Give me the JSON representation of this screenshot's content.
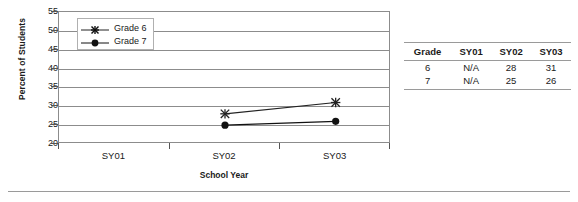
{
  "chart_data": {
    "type": "line",
    "title": "",
    "xlabel": "School Year",
    "ylabel": "Percent of Students",
    "categories": [
      "SY01",
      "SY02",
      "SY03"
    ],
    "ylim": [
      20,
      55
    ],
    "ytick_step": 5,
    "yticks": [
      55,
      50,
      45,
      40,
      35,
      30,
      25,
      20
    ],
    "grid": true,
    "legend_position": "top-left-inside",
    "series": [
      {
        "name": "Grade 6",
        "marker": "asterisk",
        "color": "#222222",
        "values": [
          null,
          28,
          31
        ]
      },
      {
        "name": "Grade 7",
        "marker": "filled-circle",
        "color": "#111111",
        "values": [
          null,
          25,
          26
        ]
      }
    ]
  },
  "chart": {
    "y_axis_title": "Percent of Students",
    "x_axis_title": "School Year",
    "y_tick_labels": [
      "55",
      "50",
      "45",
      "40",
      "35",
      "30",
      "25",
      "20"
    ],
    "x_tick_labels": [
      "SY01",
      "SY02",
      "SY03"
    ],
    "legend": [
      {
        "label": "Grade 6",
        "marker": "asterisk"
      },
      {
        "label": "Grade 7",
        "marker": "filled-circle"
      }
    ]
  },
  "table": {
    "headers": [
      "Grade",
      "SY01",
      "SY02",
      "SY03"
    ],
    "rows": [
      [
        "6",
        "N/A",
        "28",
        "31"
      ],
      [
        "7",
        "N/A",
        "25",
        "26"
      ]
    ]
  },
  "colors": {
    "axis": "#8c8c8c",
    "rule": "#9a9a9a",
    "text": "#1a1a1a",
    "series_grade6": "#222222",
    "series_grade7": "#111111"
  }
}
